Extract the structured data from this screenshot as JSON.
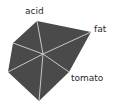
{
  "chart_data": {
    "type": "radar",
    "title": "",
    "shape_fill": "#4a4a4a",
    "spoke_color": "#c8c8c8",
    "center": [
      43,
      54
    ],
    "vertices": [
      {
        "label": "acid",
        "point": [
          37,
          21
        ]
      },
      {
        "label": "fat",
        "point": [
          91,
          32
        ]
      },
      {
        "label": "tomato",
        "point": [
          69,
          72
        ]
      },
      {
        "label": "",
        "point": [
          39,
          101
        ]
      },
      {
        "label": "",
        "point": [
          8,
          72
        ]
      },
      {
        "label": "",
        "point": [
          13,
          43
        ]
      }
    ],
    "visible_labels": [
      "acid",
      "fat",
      "tomato"
    ],
    "grid": false,
    "legend": "none"
  },
  "labels": {
    "acid": "acid",
    "fat": "fat",
    "tomato": "tomato"
  }
}
